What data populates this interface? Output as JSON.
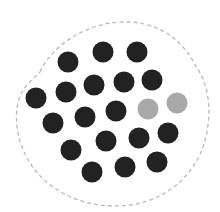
{
  "diagram": {
    "boundary": {
      "stroke": "#b9b9b9",
      "dash": "4 3",
      "shape": "dashed-blob"
    },
    "colors": {
      "dark": "#222222",
      "light": "#a9a9a9"
    },
    "dot_radius": 10.5,
    "dots": [
      {
        "x": 68,
        "y": 62,
        "c": "dark"
      },
      {
        "x": 103,
        "y": 52,
        "c": "dark"
      },
      {
        "x": 137,
        "y": 52,
        "c": "dark"
      },
      {
        "x": 94,
        "y": 85,
        "c": "dark"
      },
      {
        "x": 124,
        "y": 82,
        "c": "dark"
      },
      {
        "x": 152,
        "y": 80,
        "c": "dark"
      },
      {
        "x": 36,
        "y": 98,
        "c": "dark"
      },
      {
        "x": 66,
        "y": 92,
        "c": "dark"
      },
      {
        "x": 148,
        "y": 109,
        "c": "light"
      },
      {
        "x": 177,
        "y": 103,
        "c": "light"
      },
      {
        "x": 116,
        "y": 111,
        "c": "dark"
      },
      {
        "x": 85,
        "y": 117,
        "c": "dark"
      },
      {
        "x": 53,
        "y": 123,
        "c": "dark"
      },
      {
        "x": 168,
        "y": 133,
        "c": "dark"
      },
      {
        "x": 139,
        "y": 138,
        "c": "dark"
      },
      {
        "x": 106,
        "y": 141,
        "c": "dark"
      },
      {
        "x": 71,
        "y": 150,
        "c": "dark"
      },
      {
        "x": 157,
        "y": 162,
        "c": "dark"
      },
      {
        "x": 125,
        "y": 167,
        "c": "dark"
      },
      {
        "x": 92,
        "y": 172,
        "c": "dark"
      }
    ],
    "counts": {
      "dark": 18,
      "light": 2,
      "total": 20
    }
  }
}
